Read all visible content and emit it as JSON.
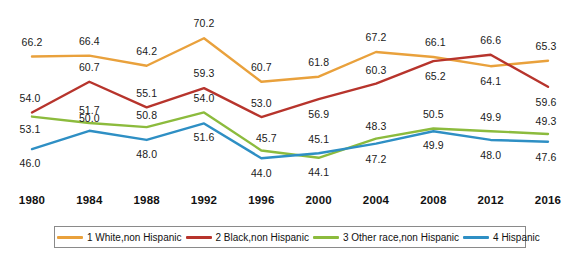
{
  "chart_data": {
    "type": "line",
    "title": "",
    "subtitle": "",
    "xlabel": "",
    "ylabel": "",
    "grid": false,
    "legend_position": "bottom",
    "ylim": [
      41,
      72
    ],
    "categories": [
      "1980",
      "1984",
      "1988",
      "1992",
      "1996",
      "2000",
      "2004",
      "2008",
      "2012",
      "2016"
    ],
    "series": [
      {
        "name": "1 White,non Hispanic",
        "color": "#E9A13C",
        "values": [
          66.2,
          66.4,
          64.2,
          70.2,
          60.7,
          61.8,
          67.2,
          66.1,
          64.1,
          65.3
        ],
        "label_offsets": [
          {
            "dx": 0,
            "dy": -15
          },
          {
            "dx": 0,
            "dy": -15
          },
          {
            "dx": 0,
            "dy": -15
          },
          {
            "dx": 0,
            "dy": -15
          },
          {
            "dx": 0,
            "dy": -15
          },
          {
            "dx": 0,
            "dy": -15
          },
          {
            "dx": 0,
            "dy": -15
          },
          {
            "dx": 2,
            "dy": -15
          },
          {
            "dx": 0,
            "dy": 15
          },
          {
            "dx": -2,
            "dy": -15
          }
        ]
      },
      {
        "name": "2 Black,non Hispanic",
        "color": "#B7342C",
        "values": [
          54.0,
          60.7,
          55.1,
          59.3,
          53.0,
          56.9,
          60.3,
          65.2,
          66.6,
          59.6
        ],
        "label_offsets": [
          {
            "dx": -2,
            "dy": -14
          },
          {
            "dx": 0,
            "dy": -15
          },
          {
            "dx": 0,
            "dy": -14
          },
          {
            "dx": 0,
            "dy": -15
          },
          {
            "dx": 0,
            "dy": -14
          },
          {
            "dx": 0,
            "dy": 15
          },
          {
            "dx": 0,
            "dy": -14
          },
          {
            "dx": 2,
            "dy": 15
          },
          {
            "dx": 0,
            "dy": -15
          },
          {
            "dx": -2,
            "dy": 15
          }
        ]
      },
      {
        "name": "3 Other race,non Hispanic",
        "color": "#8CBB3D",
        "values": [
          53.1,
          51.7,
          50.8,
          54.0,
          45.7,
          44.1,
          48.3,
          50.5,
          49.9,
          49.3
        ],
        "label_offsets": [
          {
            "dx": -2,
            "dy": 12
          },
          {
            "dx": 0,
            "dy": -13
          },
          {
            "dx": 0,
            "dy": -12
          },
          {
            "dx": 0,
            "dy": -14
          },
          {
            "dx": 5,
            "dy": -12
          },
          {
            "dx": 0,
            "dy": 14
          },
          {
            "dx": 0,
            "dy": -13
          },
          {
            "dx": 0,
            "dy": -14
          },
          {
            "dx": 0,
            "dy": -14
          },
          {
            "dx": -2,
            "dy": -13
          }
        ]
      },
      {
        "name": "4 Hispanic",
        "color": "#2E8FC4",
        "values": [
          46.0,
          50.0,
          48.0,
          51.6,
          44.0,
          45.1,
          47.2,
          49.9,
          48.0,
          47.6
        ],
        "label_offsets": [
          {
            "dx": -2,
            "dy": 14
          },
          {
            "dx": 0,
            "dy": -13
          },
          {
            "dx": 0,
            "dy": 14
          },
          {
            "dx": 0,
            "dy": 14
          },
          {
            "dx": 0,
            "dy": 15
          },
          {
            "dx": 0,
            "dy": -14
          },
          {
            "dx": 0,
            "dy": 15
          },
          {
            "dx": 0,
            "dy": 14
          },
          {
            "dx": 0,
            "dy": 15
          },
          {
            "dx": -2,
            "dy": 15
          }
        ]
      }
    ]
  },
  "legend": {
    "items": [
      {
        "label": "1 White,non Hispanic",
        "color": "#E9A13C"
      },
      {
        "label": "2 Black,non Hispanic",
        "color": "#B7342C"
      },
      {
        "label": "3 Other race,non Hispanic",
        "color": "#8CBB3D"
      },
      {
        "label": "4 Hispanic",
        "color": "#2E8FC4"
      }
    ]
  }
}
